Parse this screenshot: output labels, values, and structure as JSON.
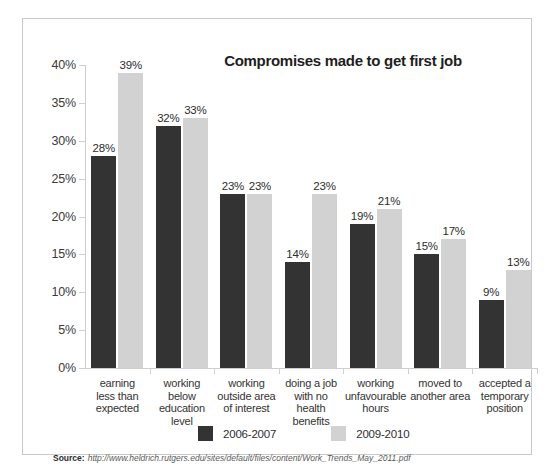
{
  "chart_data": {
    "type": "bar",
    "title": "Compromises made to get first job",
    "xlabel": "",
    "ylabel": "",
    "ylim": [
      0,
      40
    ],
    "ytick_labels": [
      "40%",
      "35%",
      "30%",
      "25%",
      "20%",
      "15%",
      "10%",
      "5%",
      "0%"
    ],
    "yticks": [
      40,
      35,
      30,
      25,
      20,
      15,
      10,
      5,
      0
    ],
    "grid": false,
    "legend_position": "bottom",
    "categories": [
      "earning\nless than\nexpected",
      "working below\neducation\nlevel",
      "working\noutside area\nof interest",
      "doing a job\nwith no\nhealth benefits",
      "working\nunfavourable\nhours",
      "moved to\nanother area",
      "accepted a\ntemporary\nposition"
    ],
    "series": [
      {
        "name": "2006-2007",
        "color": "#333333",
        "values": [
          28,
          32,
          23,
          14,
          19,
          15,
          9
        ],
        "value_labels": [
          "28%",
          "32%",
          "23%",
          "14%",
          "19%",
          "15%",
          "9%"
        ]
      },
      {
        "name": "2009-2010",
        "color": "#d2d2d2",
        "values": [
          39,
          33,
          23,
          23,
          21,
          17,
          13
        ],
        "value_labels": [
          "39%",
          "33%",
          "23%",
          "23%",
          "21%",
          "17%",
          "13%"
        ]
      }
    ]
  },
  "footer": {
    "label": "Source:",
    "url": "http://www.heldrich.rutgers.edu/sites/default/files/content/Work_Trends_May_2011.pdf"
  },
  "colors": {
    "series_2006_2007": "#333333",
    "series_2009_2010": "#d2d2d2",
    "panel_border": "#c8c8c8",
    "axis": "#cfcfcf",
    "background": "#ffffff"
  }
}
